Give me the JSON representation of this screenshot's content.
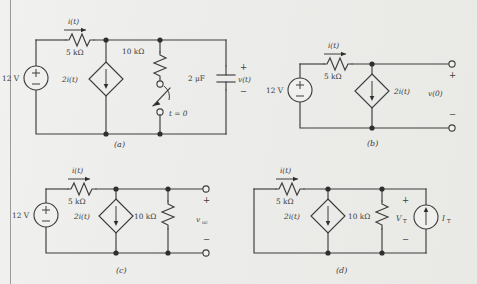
{
  "page": {
    "background_color": "#eeeeec",
    "ink_color": "#3a3a3a",
    "margin_rule": true
  },
  "figure": {
    "kind": "circuit-diagram-set",
    "subfigure_count": 4
  },
  "circuits": [
    {
      "id": "a",
      "caption": "(a)",
      "source_label": "12 V",
      "current_label": "i(t)",
      "series_resistor": "5 kΩ",
      "dependent_source": "2i(t)",
      "shunt_resistor": "10 kΩ",
      "capacitor": "2 μF",
      "switch_label": "t = 0",
      "output_plus": "+",
      "output_label": "v(t)",
      "output_minus": "−"
    },
    {
      "id": "b",
      "caption": "(b)",
      "source_label": "12 V",
      "current_label": "i(t)",
      "series_resistor": "5 kΩ",
      "dependent_source": "2i(t)",
      "output_plus": "+",
      "output_label": "v(0)",
      "output_minus": "−"
    },
    {
      "id": "c",
      "caption": "(c)",
      "source_label": "12 V",
      "current_label": "i(t)",
      "series_resistor": "5 kΩ",
      "dependent_source": "2i(t)",
      "shunt_resistor": "10 kΩ",
      "output_plus": "+",
      "output_label": "v",
      "output_label_sub": "oc",
      "output_minus": "−"
    },
    {
      "id": "d",
      "caption": "(d)",
      "current_label": "i(t)",
      "series_resistor": "5 kΩ",
      "dependent_source": "2i(t)",
      "shunt_resistor": "10 kΩ",
      "test_voltage": "V",
      "test_voltage_sub": "T",
      "test_current": "I",
      "test_current_sub": "T",
      "output_plus": "+",
      "output_minus": "−"
    }
  ]
}
